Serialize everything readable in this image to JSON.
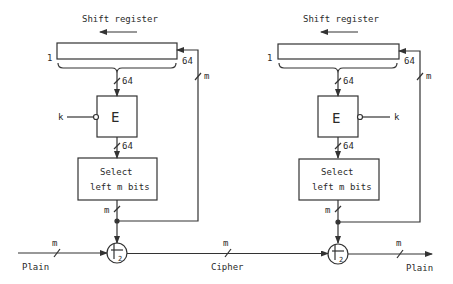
{
  "diagram": {
    "type": "cipher-feedback-mode",
    "stroke_color": "#333333",
    "left_unit": {
      "shift_register_label": "Shift register",
      "register_start_label": "1",
      "register_end_label": "64",
      "register_output_width": "64",
      "feedback_width": "m",
      "encrypt_label": "E",
      "key_label": "k",
      "encrypt_output_width": "64",
      "select_line1": "Select",
      "select_line2": "left m bits",
      "select_output_width": "m",
      "xor_label": "2"
    },
    "right_unit": {
      "shift_register_label": "Shift register",
      "register_start_label": "1",
      "register_end_label": "64",
      "register_output_width": "64",
      "feedback_width": "m",
      "encrypt_label": "E",
      "key_label": "k",
      "encrypt_output_width": "64",
      "select_line1": "Select",
      "select_line2": "left m bits",
      "select_output_width": "m",
      "xor_label": "2"
    },
    "data_line": {
      "input_label": "Plain",
      "input_width": "m",
      "middle_label": "Cipher",
      "middle_width": "m",
      "output_label": "Plain",
      "output_width": "m"
    }
  }
}
